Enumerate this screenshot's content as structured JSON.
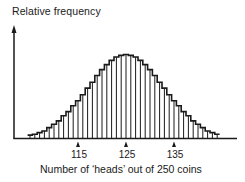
{
  "chart_data": {
    "type": "bar",
    "title": "",
    "xlabel": "Number of 'heads' out of 250 coins",
    "ylabel": "Relative frequency",
    "xticks": [
      115,
      125,
      135
    ],
    "xlim": [
      105,
      144
    ],
    "ylim": [
      0,
      1
    ],
    "grid": false,
    "legend": null,
    "distribution": "binomial(n=250, p=0.5), approx normal mean 125 sd 7.9",
    "categories": [
      105,
      106,
      107,
      108,
      109,
      110,
      111,
      112,
      113,
      114,
      115,
      116,
      117,
      118,
      119,
      120,
      121,
      122,
      123,
      124,
      125,
      126,
      127,
      128,
      129,
      130,
      131,
      132,
      133,
      134,
      135,
      136,
      137,
      138,
      139,
      140,
      141,
      142,
      143,
      144
    ],
    "values": [
      0.04,
      0.05,
      0.07,
      0.09,
      0.13,
      0.17,
      0.21,
      0.27,
      0.32,
      0.39,
      0.45,
      0.52,
      0.6,
      0.67,
      0.75,
      0.82,
      0.88,
      0.93,
      0.97,
      0.99,
      1.0,
      0.99,
      0.97,
      0.93,
      0.88,
      0.82,
      0.75,
      0.67,
      0.6,
      0.52,
      0.45,
      0.39,
      0.32,
      0.27,
      0.21,
      0.17,
      0.13,
      0.09,
      0.07,
      0.05
    ]
  },
  "labels": {
    "y_axis": "Relative frequency",
    "x_axis": "Number of ‘heads’ out of 250 coins",
    "tick_115": "115",
    "tick_125": "125",
    "tick_135": "135"
  }
}
